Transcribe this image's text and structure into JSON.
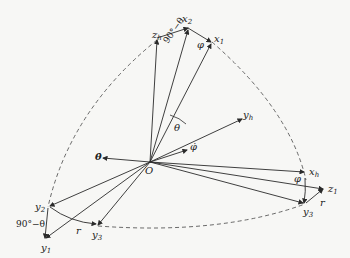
{
  "figure": {
    "type": "coordinate-system rotation diagram",
    "origin": {
      "label": "O",
      "x": 150,
      "y": 162
    },
    "line_color": "#2a2a2a",
    "dashed_arc_color": "#444444"
  },
  "labels": {
    "x2": {
      "base": "x",
      "sub": "2"
    },
    "zh": {
      "base": "z",
      "sub": "h"
    },
    "x1": {
      "base": "x",
      "sub": "1"
    },
    "angle_top": "90°−θ",
    "phi_top": "φ",
    "yh": {
      "base": "y",
      "sub": "h"
    },
    "theta": "θ",
    "theta_dot": "θ̇",
    "phi_dot": "φ̇",
    "origin": "O",
    "xh": {
      "base": "x",
      "sub": "h"
    },
    "phi_right": "φ",
    "z1": {
      "base": "z",
      "sub": "1"
    },
    "r_right": "r",
    "y3_right": {
      "base": "y",
      "sub": "3"
    },
    "y2": {
      "base": "y",
      "sub": "2"
    },
    "angle_left": "90°−θ",
    "y1": {
      "base": "y",
      "sub": "1"
    },
    "r_left": "r",
    "y3_left": {
      "base": "y",
      "sub": "3"
    }
  }
}
